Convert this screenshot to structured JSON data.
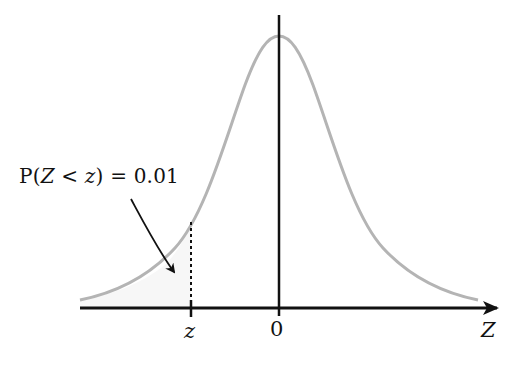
{
  "diagram": {
    "annotation": {
      "prefix": "P(",
      "variable": "Z",
      "operator": " < ",
      "bound": "z",
      "suffix": ") = 0.01"
    },
    "x_axis": {
      "label": "Z",
      "ticks": [
        {
          "label": "z"
        },
        {
          "label": "0"
        }
      ]
    },
    "tail_probability": 0.01,
    "colors": {
      "curve": "#b4b4b4",
      "axis": "#111111",
      "shaded_region": "#f7f7f7",
      "text": "#111111"
    }
  }
}
